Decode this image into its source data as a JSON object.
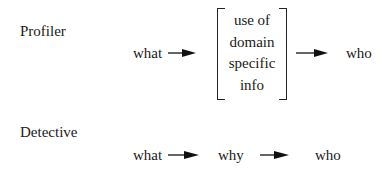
{
  "diagram": {
    "profiler": {
      "label": "Profiler",
      "steps": [
        "what",
        "who"
      ],
      "bracket_lines": [
        "use of",
        "domain",
        "specific",
        "info"
      ]
    },
    "detective": {
      "label": "Detective",
      "steps": [
        "what",
        "why",
        "who"
      ]
    }
  }
}
